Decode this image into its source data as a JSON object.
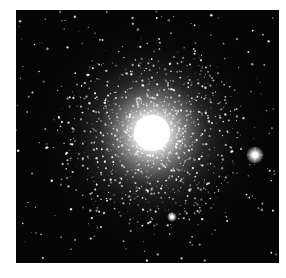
{
  "image": {
    "subject": "Globular star cluster",
    "alt": "Black-and-white telescope image of a dense globular star cluster with a bright core and a scattered field of stars",
    "background_color": "#ffffff",
    "frame_color": "#050505",
    "core_color": "#ffffff",
    "core_center": [
      136,
      123
    ],
    "bright_star_center": [
      239,
      145
    ],
    "secondary_star_center": [
      156,
      207
    ]
  }
}
